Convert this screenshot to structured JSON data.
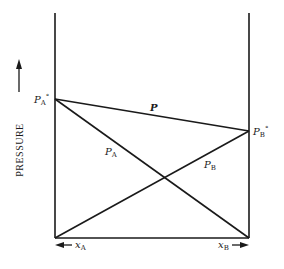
{
  "figure": {
    "type": "vapor-pressure-composition diagram (Raoult's law, ideal binary solution)",
    "y_axis_label": "PRESSURE",
    "labels": {
      "pa_pure": "P",
      "pa_pure_sub": "A",
      "pa_pure_sup": "°",
      "pb_pure": "P",
      "pb_pure_sub": "B",
      "pb_pure_sup": "°",
      "total": "P",
      "partial_a": "P",
      "partial_a_sub": "A",
      "partial_b": "P",
      "partial_b_sub": "B",
      "xa": "x",
      "xa_sub": "A",
      "xb": "x",
      "xb_sub": "B"
    },
    "lines": {
      "total_pressure": {
        "from": "PA° at x_B = 0",
        "to": "PB° at x_B = 1"
      },
      "partial_pressure_a": {
        "from": "PA° at x_B = 0",
        "to": "0 at x_B = 1"
      },
      "partial_pressure_b": {
        "from": "0 at x_B = 0",
        "to": "PB° at x_B = 1"
      }
    },
    "relative_values": {
      "pa_pure": 0.62,
      "pb_pure": 0.48
    },
    "colors": {
      "ink": "#1a1a1a",
      "background": "#ffffff"
    }
  }
}
